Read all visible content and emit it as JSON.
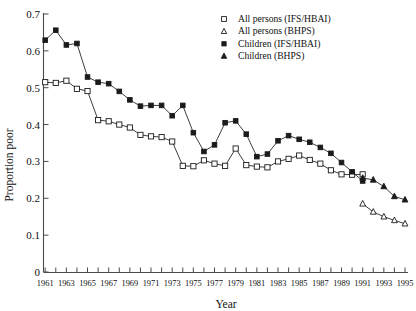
{
  "chart_data": {
    "type": "line",
    "title": "",
    "xlabel": "Year",
    "ylabel": "Proportion poor",
    "xlim": [
      1961,
      1995
    ],
    "ylim": [
      0,
      0.7
    ],
    "grid": false,
    "legend_position": "top-right",
    "x_ticks_every": 1,
    "x_tick_labels_every": 2,
    "y_tick_step": 0.1,
    "x_tick_labels": [
      "1961",
      "1963",
      "1965",
      "1967",
      "1969",
      "1971",
      "1973",
      "1975",
      "1977",
      "1979",
      "1981",
      "1983",
      "1985",
      "1987",
      "1989",
      "1991",
      "1993",
      "1995"
    ],
    "y_tick_labels": [
      "0",
      "0.1",
      "0.2",
      "0.3",
      "0.4",
      "0.5",
      "0.6",
      "0.7"
    ],
    "series": [
      {
        "name": "All persons (IFS/HBAI)",
        "marker": "open-square",
        "x": [
          1961,
          1962,
          1963,
          1964,
          1965,
          1966,
          1967,
          1968,
          1969,
          1970,
          1971,
          1972,
          1973,
          1974,
          1975,
          1976,
          1977,
          1978,
          1979,
          1980,
          1981,
          1982,
          1983,
          1984,
          1985,
          1986,
          1987,
          1988,
          1989,
          1990,
          1991
        ],
        "values": [
          0.515,
          0.513,
          0.519,
          0.497,
          0.491,
          0.412,
          0.409,
          0.4,
          0.392,
          0.372,
          0.368,
          0.366,
          0.354,
          0.288,
          0.287,
          0.303,
          0.294,
          0.288,
          0.335,
          0.29,
          0.286,
          0.284,
          0.3,
          0.307,
          0.316,
          0.304,
          0.294,
          0.276,
          0.265,
          0.264,
          0.265
        ]
      },
      {
        "name": "All persons (BHPS)",
        "marker": "open-triangle",
        "x": [
          1991,
          1992,
          1993,
          1994,
          1995
        ],
        "values": [
          0.185,
          0.163,
          0.15,
          0.14,
          0.131
        ]
      },
      {
        "name": "Children (IFS/HBAI)",
        "marker": "filled-square",
        "x": [
          1961,
          1962,
          1963,
          1964,
          1965,
          1966,
          1967,
          1968,
          1969,
          1970,
          1971,
          1972,
          1973,
          1974,
          1975,
          1976,
          1977,
          1978,
          1979,
          1980,
          1981,
          1982,
          1983,
          1984,
          1985,
          1986,
          1987,
          1988,
          1989,
          1990,
          1991
        ],
        "values": [
          0.629,
          0.656,
          0.616,
          0.62,
          0.529,
          0.515,
          0.511,
          0.49,
          0.467,
          0.45,
          0.452,
          0.452,
          0.424,
          0.452,
          0.378,
          0.327,
          0.345,
          0.405,
          0.41,
          0.374,
          0.313,
          0.32,
          0.356,
          0.37,
          0.36,
          0.352,
          0.338,
          0.322,
          0.297,
          0.272,
          0.247
        ]
      },
      {
        "name": "Children (BHPS)",
        "marker": "filled-triangle",
        "x": [
          1991,
          1992,
          1993,
          1994,
          1995
        ],
        "values": [
          0.255,
          0.25,
          0.232,
          0.205,
          0.196
        ]
      }
    ]
  },
  "legend": {
    "items": [
      {
        "label": "All persons (IFS/HBAI)",
        "marker": "open-square"
      },
      {
        "label": "All persons (BHPS)",
        "marker": "open-triangle"
      },
      {
        "label": "Children (IFS/HBAI)",
        "marker": "filled-square"
      },
      {
        "label": "Children (BHPS)",
        "marker": "filled-triangle"
      }
    ]
  },
  "colors": {
    "ink": "#1a1a1a",
    "axis": "#4a4a4a",
    "background": "#ffffff"
  }
}
